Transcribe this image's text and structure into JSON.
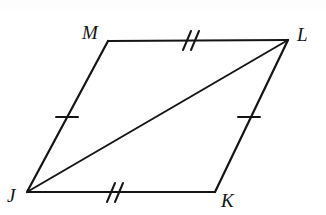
{
  "figure": {
    "name": "parallelogram-jklm",
    "kind": "geometry-diagram",
    "shape": "parallelogram",
    "background_color": "#ffffff",
    "stroke_color": "#151515",
    "stroke_width_px": 2,
    "canvas": {
      "width": 326,
      "height": 215
    }
  },
  "vertices": [
    {
      "id": "J",
      "label": "J",
      "x": 27,
      "y": 192,
      "label_x": 7,
      "label_y": 186
    },
    {
      "id": "K",
      "label": "K",
      "x": 215,
      "y": 192,
      "label_x": 221,
      "label_y": 191
    },
    {
      "id": "L",
      "label": "L",
      "x": 288,
      "y": 40,
      "label_x": 297,
      "label_y": 25
    },
    {
      "id": "M",
      "label": "M",
      "x": 108,
      "y": 41,
      "label_x": 82,
      "label_y": 23
    }
  ],
  "edges": [
    {
      "id": "ML",
      "from": "M",
      "to": "L",
      "x1": 108,
      "y1": 41,
      "x2": 288,
      "y2": 40,
      "ticks": 2
    },
    {
      "id": "LK",
      "from": "L",
      "to": "K",
      "x1": 288,
      "y1": 40,
      "x2": 215,
      "y2": 192,
      "ticks": 1
    },
    {
      "id": "KJ",
      "from": "K",
      "to": "J",
      "x1": 215,
      "y1": 192,
      "x2": 27,
      "y2": 192,
      "ticks": 2
    },
    {
      "id": "JM",
      "from": "J",
      "to": "M",
      "x1": 27,
      "y1": 192,
      "x2": 108,
      "y2": 41,
      "ticks": 1
    }
  ],
  "diagonals": [
    {
      "id": "JL",
      "from": "J",
      "to": "L",
      "x1": 27,
      "y1": 192,
      "x2": 288,
      "y2": 40
    }
  ],
  "tick_marks": [
    {
      "edge": "ML",
      "count": 2,
      "cx": 190,
      "cy": 40,
      "x1": 186,
      "y1": 49,
      "x2": 194,
      "y2": 31,
      "offset": 6
    },
    {
      "edge": "KJ",
      "count": 2,
      "cx": 114,
      "cy": 192,
      "x1": 110,
      "y1": 201,
      "x2": 118,
      "y2": 183,
      "offset": 6
    },
    {
      "edge": "JM",
      "count": 1,
      "cx": 67,
      "cy": 117,
      "x1": 57,
      "y1": 117,
      "x2": 77,
      "y2": 117,
      "offset": 0
    },
    {
      "edge": "LK",
      "count": 1,
      "cx": 249,
      "cy": 117,
      "x1": 239,
      "y1": 117,
      "x2": 259,
      "y2": 117,
      "offset": 0
    }
  ],
  "congruence_groups": [
    {
      "marks": 2,
      "edges": [
        "ML",
        "KJ"
      ]
    },
    {
      "marks": 1,
      "edges": [
        "JM",
        "LK"
      ]
    }
  ]
}
